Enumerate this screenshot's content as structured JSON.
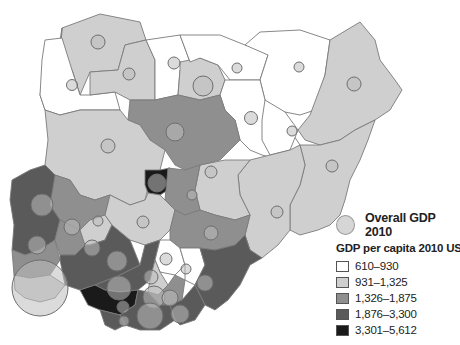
{
  "legend": {
    "bubble_label": "Overall GDP 2010",
    "title": "GDP per capita 2010 US$",
    "classes": [
      {
        "label": "610–930",
        "color": "#ffffff"
      },
      {
        "label": "931–1,325",
        "color": "#cfcfcf"
      },
      {
        "label": "1,326–1,875",
        "color": "#8f8f8f"
      },
      {
        "label": "1,876–3,300",
        "color": "#5a5a5a"
      },
      {
        "label": "3,301–5,612",
        "color": "#1a1a1a"
      }
    ]
  },
  "map": {
    "subject": "Nigeria states",
    "bubble_color": "#bdbdbd",
    "border_color": "#7a7a7a"
  }
}
